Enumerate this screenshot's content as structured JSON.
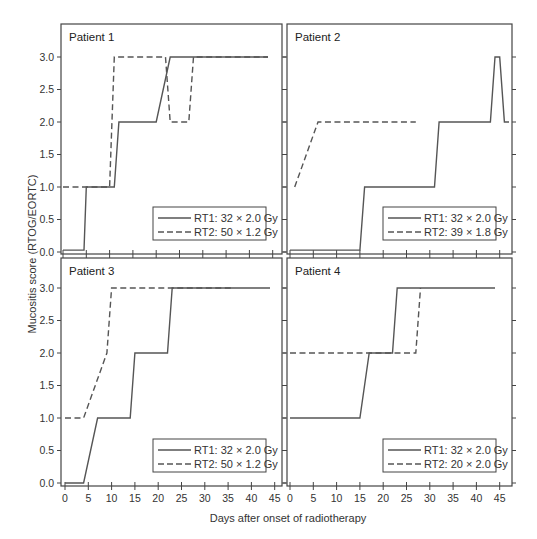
{
  "chart_data": {
    "type": "line",
    "layout": "2x2 grid of panels, shared axes",
    "xlabel": "Days after onset of radiotherapy",
    "ylabel": "Mucositis score (RTOG/EORTC)",
    "xlim": [
      0,
      47
    ],
    "ylim": [
      -0.05,
      3.45
    ],
    "x_ticks": [
      0,
      5,
      10,
      15,
      20,
      25,
      30,
      35,
      40,
      45
    ],
    "x_tick_labels": [
      "0",
      "5",
      "10",
      "15",
      "20",
      "25",
      "30",
      "35",
      "40",
      "45"
    ],
    "y_ticks": [
      0.0,
      0.5,
      1.0,
      1.5,
      2.0,
      2.5,
      3.0
    ],
    "y_tick_labels": [
      "0.0",
      "0.5",
      "1.0",
      "1.5",
      "2.0",
      "2.5",
      "3.0"
    ],
    "grid": false,
    "legend_position": "lower right",
    "colors": {
      "line": "#555555",
      "axis": "#444444"
    },
    "panels": [
      {
        "title": "Patient 1",
        "series": [
          {
            "name": "RT1: 32 × 2.0 Gy",
            "style": "solid",
            "x": [
              0,
              4.5,
              5,
              11,
              12,
              20,
              23,
              44
            ],
            "y": [
              0.03,
              0.03,
              1,
              1,
              2,
              2,
              3,
              3
            ]
          },
          {
            "name": "RT2: 50 × 1.2 Gy",
            "style": "dashed",
            "x": [
              0,
              10,
              11,
              22,
              23,
              27,
              28,
              44
            ],
            "y": [
              1,
              1,
              3,
              3,
              2,
              2,
              3,
              3
            ]
          }
        ]
      },
      {
        "title": "Patient 2",
        "series": [
          {
            "name": "RT1: 32 × 2.0 Gy",
            "style": "solid",
            "x": [
              0,
              15,
              16,
              31,
              32,
              43,
              44,
              45,
              46,
              47
            ],
            "y": [
              0.03,
              0.03,
              1,
              1,
              2,
              2,
              3,
              3,
              2,
              2
            ]
          },
          {
            "name": "RT2: 39 × 1.8 Gy",
            "style": "dashed",
            "x": [
              1,
              6,
              27
            ],
            "y": [
              1,
              2,
              2
            ]
          }
        ]
      },
      {
        "title": "Patient 3",
        "series": [
          {
            "name": "RT1: 32 × 2.0 Gy",
            "style": "solid",
            "x": [
              0,
              4,
              7,
              14,
              15,
              22,
              23,
              44
            ],
            "y": [
              0,
              0,
              1,
              1,
              2,
              2,
              3,
              3
            ]
          },
          {
            "name": "RT2: 50 × 1.2 Gy",
            "style": "dashed",
            "x": [
              0,
              4,
              9,
              10,
              36
            ],
            "y": [
              1,
              1,
              2,
              3,
              3
            ]
          }
        ]
      },
      {
        "title": "Patient 4",
        "series": [
          {
            "name": "RT1: 32 × 2.0 Gy",
            "style": "solid",
            "x": [
              0,
              15,
              17,
              22,
              23,
              44
            ],
            "y": [
              1,
              1,
              2,
              2,
              3,
              3
            ]
          },
          {
            "name": "RT2: 20 × 2.0 Gy",
            "style": "dashed",
            "x": [
              0,
              27,
              28
            ],
            "y": [
              2,
              2,
              3
            ]
          }
        ]
      }
    ]
  }
}
